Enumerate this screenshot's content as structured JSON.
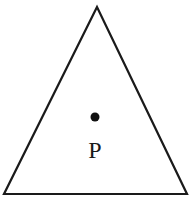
{
  "diagram": {
    "shape": "triangle",
    "vertices": [
      [
        97,
        7
      ],
      [
        4,
        194
      ],
      [
        187,
        194
      ]
    ],
    "stroke_color": "#1a1a1a",
    "point": {
      "x": 95,
      "y": 117,
      "radius": 4.5,
      "label": "P"
    }
  }
}
